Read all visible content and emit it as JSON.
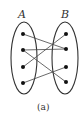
{
  "diagram": {
    "set_a_label": "A",
    "set_b_label": "B",
    "caption": "(a)",
    "set_a_points": [
      1,
      2,
      3,
      4
    ],
    "set_b_points": [
      1,
      2,
      3,
      4
    ],
    "mappings": [
      {
        "from": "A1",
        "to": "B2"
      },
      {
        "from": "A2",
        "to": "B2"
      },
      {
        "from": "A2",
        "to": "B4"
      },
      {
        "from": "A3",
        "to": "B1"
      },
      {
        "from": "A4",
        "to": "B3"
      }
    ],
    "colors": {
      "stroke": "#333333",
      "dot": "#111111",
      "background": "#ffffff"
    }
  }
}
